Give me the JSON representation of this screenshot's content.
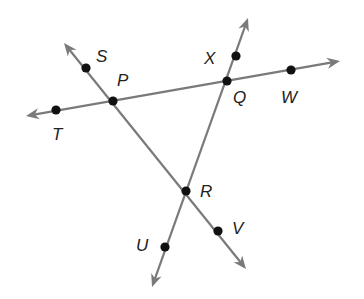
{
  "diagram": {
    "type": "geometry-lines",
    "colors": {
      "line": "#7a7a7a",
      "point": "#111111",
      "label": "#222222"
    },
    "lines": [
      {
        "name": "line-TW",
        "through": [
          "T",
          "P",
          "Q",
          "W"
        ],
        "from": [
          26,
          116
        ],
        "to": [
          340,
          61
        ],
        "arrows": "both"
      },
      {
        "name": "line-SV",
        "through": [
          "S",
          "P",
          "R",
          "V"
        ],
        "from": [
          64,
          43
        ],
        "to": [
          246,
          269
        ],
        "arrows": "both"
      },
      {
        "name": "line-XU",
        "through": [
          "X",
          "Q",
          "R",
          "U"
        ],
        "from": [
          248,
          18
        ],
        "to": [
          152,
          287
        ],
        "arrows": "both"
      }
    ],
    "points": [
      {
        "id": "S",
        "label": "S",
        "x": 86,
        "y": 68,
        "lx": 96,
        "ly": 62
      },
      {
        "id": "P",
        "label": "P",
        "x": 113,
        "y": 101,
        "lx": 117,
        "ly": 86
      },
      {
        "id": "T",
        "label": "T",
        "x": 56,
        "y": 110,
        "lx": 52,
        "ly": 140
      },
      {
        "id": "X",
        "label": "X",
        "x": 236,
        "y": 56,
        "lx": 204,
        "ly": 64
      },
      {
        "id": "Q",
        "label": "Q",
        "x": 227,
        "y": 81,
        "lx": 233,
        "ly": 103
      },
      {
        "id": "W",
        "label": "W",
        "x": 291,
        "y": 70,
        "lx": 281,
        "ly": 103
      },
      {
        "id": "R",
        "label": "R",
        "x": 186,
        "y": 191,
        "lx": 200,
        "ly": 197
      },
      {
        "id": "U",
        "label": "U",
        "x": 165,
        "y": 247,
        "lx": 136,
        "ly": 251
      },
      {
        "id": "V",
        "label": "V",
        "x": 218,
        "y": 231,
        "lx": 232,
        "ly": 234
      }
    ],
    "labels": {
      "S": "S",
      "P": "P",
      "T": "T",
      "X": "X",
      "Q": "Q",
      "W": "W",
      "R": "R",
      "U": "U",
      "V": "V"
    }
  }
}
